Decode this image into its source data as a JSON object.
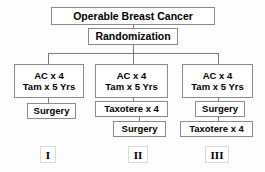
{
  "diagram": {
    "title": "Operable Breast Cancer",
    "randomization": "Randomization",
    "arms": [
      {
        "numeral": "I",
        "head_line1": "AC x 4",
        "head_line2": "Tam x 5 Yrs",
        "steps": [
          "Surgery"
        ]
      },
      {
        "numeral": "II",
        "head_line1": "AC x 4",
        "head_line2": "Tam x 5 Yrs",
        "steps": [
          "Taxotere x 4",
          "Surgery"
        ]
      },
      {
        "numeral": "III",
        "head_line1": "AC x 4",
        "head_line2": "Tam x 5 Yrs",
        "steps": [
          "Surgery",
          "Taxotere x 4"
        ]
      }
    ],
    "colors": {
      "background": "#fdfdfd",
      "box_border": "#8a8a8a",
      "connector": "#7d7d7d",
      "text": "#000000"
    }
  }
}
